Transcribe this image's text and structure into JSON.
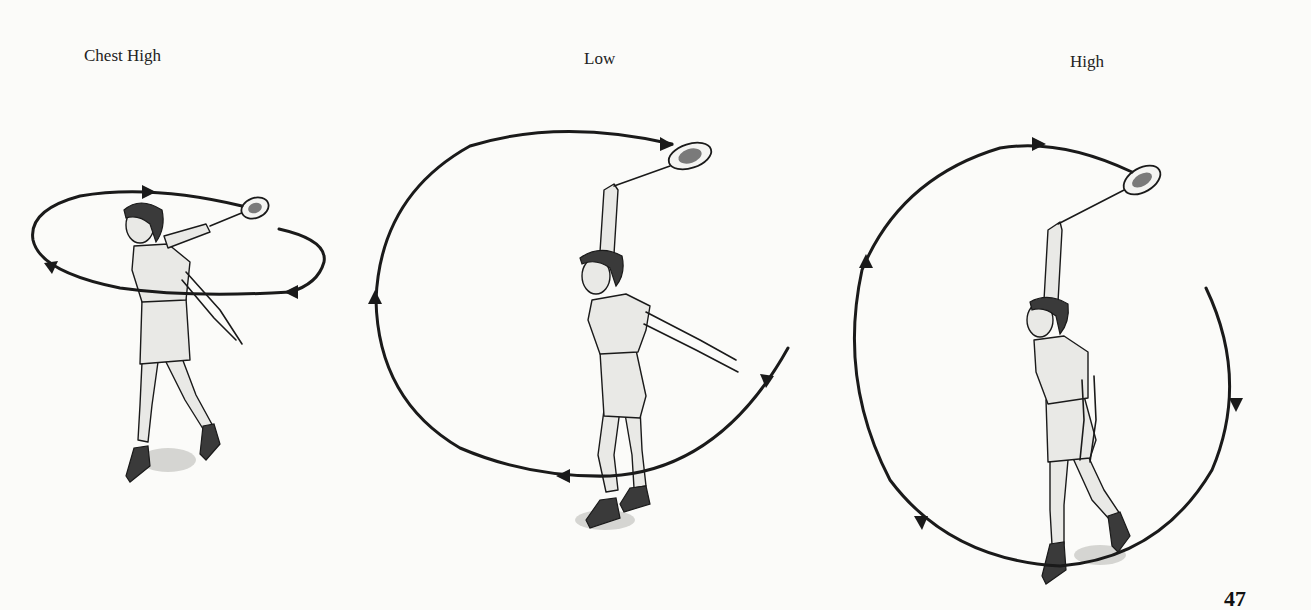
{
  "page": {
    "number": "47"
  },
  "figures": [
    {
      "id": "chest-high",
      "caption": "Chest High",
      "swing_path": "horizontal ellipse at chest height, clockwise arrows"
    },
    {
      "id": "low",
      "caption": "Low",
      "swing_path": "large vertical loop passing low near the feet"
    },
    {
      "id": "high",
      "caption": "High",
      "swing_path": "large vertical circle above the head"
    }
  ],
  "colors": {
    "paper": "#fbfbf9",
    "ink": "#1a1a1a"
  }
}
